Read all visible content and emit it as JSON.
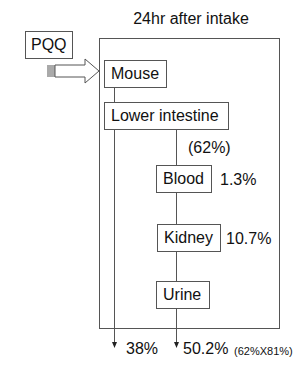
{
  "title": "24hr after intake",
  "input": {
    "label": "PQQ"
  },
  "nodes": {
    "mouse": "Mouse",
    "lower_intestine": "Lower intestine",
    "blood": "Blood",
    "kidney": "Kidney",
    "urine": "Urine"
  },
  "annotations": {
    "absorbed": "(62%)",
    "blood_pct": "1.3%",
    "kidney_pct": "10.7%"
  },
  "outputs": {
    "feces_pct": "38%",
    "urine_pct": "50.2%",
    "urine_calc": "(62%X81%)"
  },
  "colors": {
    "line": "#555555",
    "text": "#111111",
    "background": "#ffffff"
  }
}
